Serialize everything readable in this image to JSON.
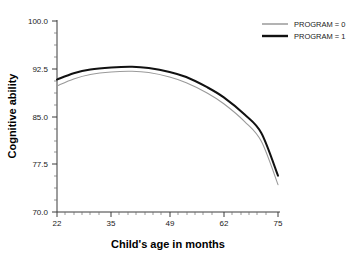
{
  "chart_data": {
    "type": "line",
    "title": "",
    "xlabel": "Child's age in months",
    "ylabel": "Cognitive ability",
    "xlim": [
      22,
      75
    ],
    "ylim": [
      70.0,
      100.0
    ],
    "grid": false,
    "legend_position": "top-right",
    "xticks": [
      22,
      35,
      49,
      62,
      75
    ],
    "xtick_labels": [
      "22",
      "35",
      "49",
      "62",
      "75"
    ],
    "yticks": [
      70.0,
      77.5,
      85.0,
      92.5,
      100.0
    ],
    "ytick_labels": [
      "70.0",
      "77.5",
      "85.0",
      "92.5",
      "100.0"
    ],
    "x": [
      22,
      26,
      30,
      35,
      40,
      44,
      49,
      53,
      58,
      62,
      67,
      71,
      75
    ],
    "series": [
      {
        "name": "PROGRAM = 0",
        "color": "#9a9a9a",
        "line_width": 1.1,
        "values": [
          89.8,
          90.9,
          91.6,
          92.0,
          92.1,
          91.9,
          91.2,
          90.3,
          88.7,
          87.0,
          84.2,
          81.1,
          74.3
        ]
      },
      {
        "name": "PROGRAM = 1",
        "color": "#111111",
        "line_width": 2.0,
        "values": [
          90.8,
          91.8,
          92.4,
          92.7,
          92.8,
          92.6,
          92.0,
          91.2,
          89.6,
          88.0,
          85.3,
          82.4,
          75.7
        ]
      }
    ],
    "legend": [
      {
        "label": "PROGRAM = 0",
        "color": "#9a9a9a",
        "line_width": 1.1
      },
      {
        "label": "PROGRAM = 1",
        "color": "#111111",
        "line_width": 2.0
      }
    ]
  },
  "axes": {
    "y_axis_title": "Cognitive ability",
    "x_axis_title": "Child's age in months",
    "y_labels": {
      "t100": "100.0",
      "t92": "92.5",
      "t85": "85.0",
      "t77": "77.5",
      "t70": "70.0"
    },
    "x_labels": {
      "t22": "22",
      "t35": "35",
      "t49": "49",
      "t62": "62",
      "t75": "75"
    }
  },
  "legend": {
    "item0_label": "PROGRAM = 0",
    "item1_label": "PROGRAM = 1"
  },
  "colors": {
    "background": "#ffffff",
    "axis": "#3a3a3a",
    "series_0": "#9a9a9a",
    "series_1": "#111111",
    "text": "#1a1a1a"
  }
}
